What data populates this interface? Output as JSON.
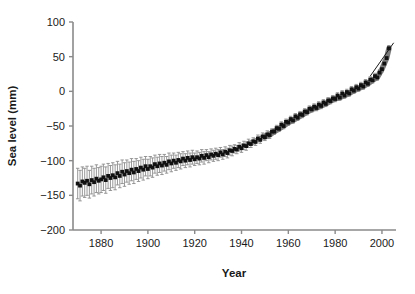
{
  "chart_data": {
    "type": "line",
    "title": "",
    "xlabel": "Year",
    "ylabel": "Sea level (mm)",
    "xlim": [
      1868,
      2006
    ],
    "ylim": [
      -200,
      100
    ],
    "xticks": [
      1880,
      1900,
      1920,
      1940,
      1960,
      1980,
      2000
    ],
    "xticklabels": [
      "1880",
      "1900",
      "1920",
      "1940",
      "1960",
      "1980",
      "2000"
    ],
    "yticks": [
      100,
      50,
      0,
      -50,
      -100,
      -150,
      -200
    ],
    "yticklabels": [
      "100",
      "50",
      "0",
      "-50",
      "-100",
      "-150",
      "-200"
    ],
    "grid": false,
    "legend": "none",
    "colors": {
      "marker": "#111111",
      "errorbar": "#8c8c8c",
      "smooth_band": "#7a7a7a",
      "axis": "#8a8a8a",
      "text": "#1a1a1a"
    },
    "series": [
      {
        "name": "Annual mean sea level (tide gauge reconstruction)",
        "marker": "square",
        "marker_color": "#111111",
        "errorbar_color": "#8c8c8c",
        "x": [
          1870,
          1871,
          1872,
          1873,
          1874,
          1875,
          1876,
          1877,
          1878,
          1879,
          1880,
          1881,
          1882,
          1883,
          1884,
          1885,
          1886,
          1887,
          1888,
          1889,
          1890,
          1891,
          1892,
          1893,
          1894,
          1895,
          1896,
          1897,
          1898,
          1899,
          1900,
          1901,
          1902,
          1903,
          1904,
          1905,
          1906,
          1907,
          1908,
          1909,
          1910,
          1911,
          1912,
          1913,
          1914,
          1915,
          1916,
          1917,
          1918,
          1919,
          1920,
          1921,
          1922,
          1923,
          1924,
          1925,
          1926,
          1927,
          1928,
          1929,
          1930,
          1931,
          1932,
          1933,
          1934,
          1935,
          1936,
          1937,
          1938,
          1939,
          1940,
          1941,
          1942,
          1943,
          1944,
          1945,
          1946,
          1947,
          1948,
          1949,
          1950,
          1951,
          1952,
          1953,
          1954,
          1955,
          1956,
          1957,
          1958,
          1959,
          1960,
          1961,
          1962,
          1963,
          1964,
          1965,
          1966,
          1967,
          1968,
          1969,
          1970,
          1971,
          1972,
          1973,
          1974,
          1975,
          1976,
          1977,
          1978,
          1979,
          1980,
          1981,
          1982,
          1983,
          1984,
          1985,
          1986,
          1987,
          1988,
          1989,
          1990,
          1991,
          1992,
          1993,
          1994,
          1995,
          1996,
          1997,
          1998,
          1999,
          2000,
          2001,
          2002,
          2003
        ],
        "y": [
          -133,
          -136,
          -130,
          -132,
          -129,
          -134,
          -128,
          -131,
          -126,
          -129,
          -127,
          -124,
          -128,
          -122,
          -125,
          -121,
          -124,
          -118,
          -122,
          -116,
          -120,
          -115,
          -118,
          -113,
          -117,
          -112,
          -115,
          -110,
          -113,
          -108,
          -112,
          -108,
          -110,
          -105,
          -108,
          -104,
          -107,
          -103,
          -106,
          -101,
          -104,
          -100,
          -103,
          -99,
          -101,
          -97,
          -100,
          -96,
          -99,
          -95,
          -98,
          -95,
          -97,
          -93,
          -96,
          -92,
          -95,
          -91,
          -93,
          -90,
          -92,
          -88,
          -91,
          -87,
          -89,
          -85,
          -86,
          -83,
          -84,
          -80,
          -82,
          -78,
          -79,
          -75,
          -76,
          -72,
          -73,
          -68,
          -70,
          -65,
          -66,
          -62,
          -63,
          -58,
          -58,
          -53,
          -54,
          -48,
          -50,
          -44,
          -45,
          -40,
          -42,
          -36,
          -38,
          -33,
          -34,
          -29,
          -30,
          -25,
          -26,
          -22,
          -24,
          -19,
          -21,
          -16,
          -18,
          -13,
          -14,
          -10,
          -11,
          -6,
          -9,
          -3,
          -6,
          -1,
          -3,
          3,
          1,
          6,
          4,
          9,
          7,
          13,
          11,
          17,
          16,
          22,
          20,
          27,
          32,
          40,
          48,
          62
        ],
        "yerr": [
          22,
          22,
          21,
          21,
          21,
          20,
          20,
          20,
          20,
          19,
          19,
          19,
          19,
          18,
          18,
          18,
          18,
          17,
          17,
          17,
          17,
          16,
          16,
          16,
          16,
          15,
          15,
          15,
          15,
          14,
          14,
          14,
          14,
          13,
          13,
          13,
          13,
          12,
          12,
          12,
          12,
          11,
          11,
          11,
          11,
          10,
          10,
          10,
          10,
          10,
          9,
          9,
          9,
          9,
          9,
          8,
          8,
          8,
          8,
          8,
          8,
          7,
          7,
          7,
          7,
          7,
          7,
          6,
          6,
          6,
          6,
          6,
          6,
          6,
          5,
          5,
          5,
          5,
          5,
          5,
          5,
          5,
          5,
          4,
          4,
          4,
          4,
          4,
          4,
          4,
          4,
          4,
          4,
          4,
          4,
          4,
          4,
          4,
          4,
          4,
          4,
          4,
          4,
          4,
          4,
          4,
          4,
          4,
          4,
          4,
          4,
          4,
          4,
          4,
          4,
          4,
          4,
          4,
          4,
          4,
          4,
          4,
          4,
          4,
          4,
          4,
          4,
          4,
          4,
          4,
          4,
          4,
          4,
          4
        ]
      },
      {
        "name": "Satellite altimetry / smoothed band",
        "style": "thick-gray-line",
        "color": "#7a7a7a",
        "x": [
          1950,
          1952,
          1954,
          1956,
          1958,
          1960,
          1962,
          1964,
          1966,
          1968,
          1970,
          1972,
          1974,
          1976,
          1978,
          1980,
          1982,
          1984,
          1986,
          1988,
          1990,
          1992,
          1994,
          1996,
          1998,
          2000,
          2002,
          2003
        ],
        "y": [
          -66,
          -63,
          -58,
          -54,
          -50,
          -45,
          -42,
          -38,
          -34,
          -30,
          -26,
          -24,
          -21,
          -18,
          -14,
          -11,
          -9,
          -6,
          -3,
          1,
          4,
          7,
          11,
          16,
          20,
          32,
          48,
          62
        ]
      },
      {
        "name": "Trend line (thin)",
        "style": "thin-black-line",
        "color": "#1a1a1a",
        "x": [
          1995,
          2005
        ],
        "y": [
          22,
          70
        ]
      }
    ]
  }
}
